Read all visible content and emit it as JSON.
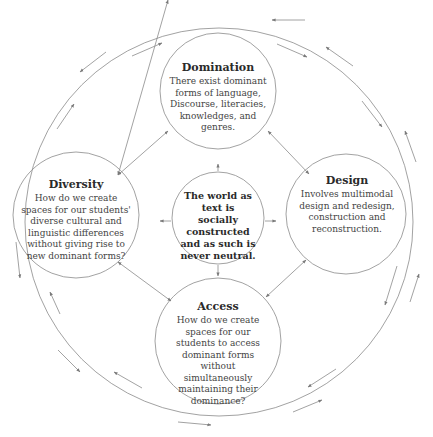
{
  "diagram": {
    "center": {
      "text": "The world as text is socially constructed and as such is never neutral."
    },
    "nodes": {
      "domination": {
        "title": "Domination",
        "body": "There exist dominant forms of language, Discourse, literacies, knowledges, and genres."
      },
      "diversity": {
        "title": "Diversity",
        "body": "How do we create spaces for our students' diverse cultural and linguistic differences without giving rise to new dominant forms?"
      },
      "design": {
        "title": "Design",
        "body": "Involves multimodal design and redesign, construction and reconstruction."
      },
      "access": {
        "title": "Access",
        "body": "How do we create spaces for our students to access dominant forms without simultaneously maintaining their dominance?"
      }
    },
    "colors": {
      "line": "#8a8a8a",
      "arrow": "#7a7a7a",
      "text": "#3a3a3a"
    }
  }
}
